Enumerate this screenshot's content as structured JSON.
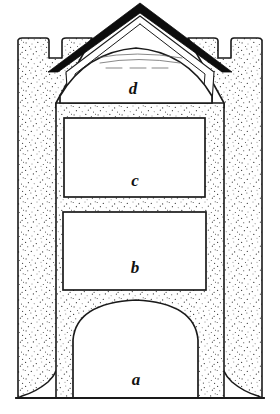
{
  "figure": {
    "kind": "architectural-elevation-drawing",
    "technique": "stipple-engraving",
    "background_color": "#ffffff",
    "ink_color": "#1a1a1a",
    "roof_color": "#0d0d0d",
    "canvas": {
      "width": 280,
      "height": 414
    }
  },
  "labels": [
    {
      "id": "a",
      "text": "a",
      "x": 136,
      "y": 385,
      "refers_to": "arched-doorway"
    },
    {
      "id": "b",
      "text": "b",
      "x": 135,
      "y": 273,
      "refers_to": "lower-rectangular-window"
    },
    {
      "id": "c",
      "text": "c",
      "x": 135,
      "y": 186,
      "refers_to": "upper-rectangular-window"
    },
    {
      "id": "d",
      "text": "d",
      "x": 133,
      "y": 94,
      "refers_to": "gable-tympanum-opening"
    }
  ],
  "openings": [
    {
      "id": "doorway-a",
      "label": "a",
      "shape": "round-arched",
      "left": 73,
      "right": 198,
      "crown_y": 300,
      "base_y": 398
    },
    {
      "id": "window-b",
      "label": "b",
      "shape": "rectangular",
      "left": 63,
      "top": 212,
      "right": 206,
      "bottom": 290
    },
    {
      "id": "window-c",
      "label": "c",
      "shape": "rectangular",
      "left": 64,
      "top": 118,
      "right": 205,
      "bottom": 197
    },
    {
      "id": "tympanum-d",
      "label": "d",
      "shape": "segmental-arched",
      "left": 60,
      "right": 212,
      "crown_y": 48,
      "base_y": 103
    }
  ],
  "structure": {
    "gable_apex": {
      "x": 140,
      "y": 5
    },
    "turret_left": {
      "outer_x": 18,
      "top_y": 38
    },
    "turret_right": {
      "outer_x": 262,
      "top_y": 38
    },
    "plinth_flare_y": 355,
    "ground_line_y": 398
  }
}
